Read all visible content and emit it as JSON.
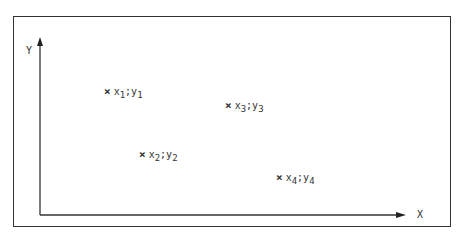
{
  "diagram": {
    "x_axis_label": "X",
    "y_axis_label": "Y",
    "marker": "×",
    "separator": ";",
    "points": [
      {
        "x": "x",
        "xi": "1",
        "y": "y",
        "yi": "1"
      },
      {
        "x": "x",
        "xi": "2",
        "y": "y",
        "yi": "2"
      },
      {
        "x": "x",
        "xi": "3",
        "y": "y",
        "yi": "3"
      },
      {
        "x": "x",
        "xi": "4",
        "y": "y",
        "yi": "4"
      }
    ]
  }
}
